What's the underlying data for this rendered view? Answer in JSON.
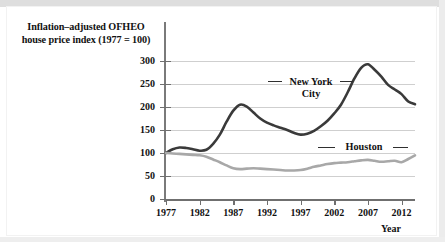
{
  "figure": {
    "y_axis_title_line1": "Inflation–adjusted OFHEO",
    "y_axis_title_line2": "house price index (1977 = 100)",
    "x_axis_title": "Year",
    "series_label_nyc_line1": "New York",
    "series_label_nyc_line2": "City",
    "series_label_houston": "Houston"
  },
  "colors": {
    "new_york_city_line": "#3a3a3a",
    "houston_line": "#a8a8a8",
    "gridline": "#cfcfcf",
    "axis": "#6f6f6f",
    "text": "#111111",
    "background": "#ffffff"
  },
  "chart_data": {
    "type": "line",
    "title": "",
    "subtitle": "",
    "xlabel": "Year",
    "ylabel": "Inflation–adjusted OFHEO house price index (1977 = 100)",
    "xlim": [
      1977,
      2014
    ],
    "ylim": [
      0,
      300
    ],
    "xticks": [
      1977,
      1982,
      1987,
      1992,
      1997,
      2002,
      2007,
      2012
    ],
    "xtick_labels": [
      "1977",
      "1982",
      "1987",
      "1992",
      "1997",
      "2002",
      "2007",
      "2012"
    ],
    "yticks": [
      0,
      50,
      100,
      150,
      200,
      250,
      300
    ],
    "ytick_labels": [
      "0",
      "50",
      "100",
      "150",
      "200",
      "250",
      "300"
    ],
    "grid": "horizontal",
    "legend": "inline-annotations",
    "x": [
      1977,
      1978,
      1979,
      1980,
      1981,
      1982,
      1983,
      1984,
      1985,
      1986,
      1987,
      1988,
      1989,
      1990,
      1991,
      1992,
      1993,
      1994,
      1995,
      1996,
      1997,
      1998,
      1999,
      2000,
      2001,
      2002,
      2003,
      2004,
      2005,
      2006,
      2007,
      2008,
      2009,
      2010,
      2011,
      2012,
      2013,
      2014
    ],
    "series": [
      {
        "name": "New York City",
        "color": "#3a3a3a",
        "values": [
          100,
          108,
          112,
          111,
          108,
          105,
          107,
          120,
          140,
          168,
          192,
          205,
          201,
          188,
          175,
          166,
          160,
          155,
          150,
          144,
          140,
          142,
          148,
          158,
          170,
          186,
          205,
          232,
          262,
          285,
          293,
          281,
          266,
          248,
          238,
          228,
          212,
          206
        ]
      },
      {
        "name": "Houston",
        "color": "#a8a8a8",
        "values": [
          100,
          99,
          98,
          97,
          96,
          95,
          92,
          86,
          80,
          73,
          67,
          65,
          66,
          67,
          66,
          65,
          64,
          63,
          62,
          62,
          63,
          66,
          70,
          73,
          76,
          78,
          79,
          80,
          82,
          84,
          85,
          83,
          81,
          82,
          83,
          80,
          87,
          95
        ]
      }
    ],
    "annotations": [
      {
        "text": "New York City",
        "x": 2000,
        "y": 250
      },
      {
        "text": "Houston",
        "x": 2008,
        "y": 110
      }
    ]
  }
}
